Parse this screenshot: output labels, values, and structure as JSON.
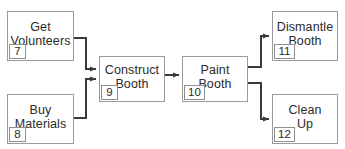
{
  "diagram": {
    "style": {
      "box_border_color": "#9a9a9a",
      "edge_color": "#3a3a3a",
      "text_color": "#2b2b2b",
      "background": "#ffffff"
    },
    "nodes": [
      {
        "id": "get-volunteers",
        "label": "Get\nVolunteers",
        "number": "7",
        "x": 7,
        "y": 11,
        "w": 67,
        "h": 50
      },
      {
        "id": "buy-materials",
        "label": "Buy\nMaterials",
        "number": "8",
        "x": 7,
        "y": 94,
        "w": 67,
        "h": 50
      },
      {
        "id": "construct-booth",
        "label": "Construct\nBooth",
        "number": "9",
        "x": 99,
        "y": 56,
        "w": 66,
        "h": 46
      },
      {
        "id": "paint-booth",
        "label": "Paint\nBooth",
        "number": "10",
        "x": 182,
        "y": 56,
        "w": 66,
        "h": 46
      },
      {
        "id": "dismantle-booth",
        "label": "Dismantle\nBooth",
        "number": "11",
        "x": 272,
        "y": 11,
        "w": 66,
        "h": 50
      },
      {
        "id": "clean-up",
        "label": "Clean\nUp",
        "number": "12",
        "x": 272,
        "y": 94,
        "w": 66,
        "h": 50
      }
    ],
    "edges": [
      {
        "id": "edge-volunteers-to-construct",
        "from": "get-volunteers",
        "to": "construct-booth"
      },
      {
        "id": "edge-materials-to-construct",
        "from": "buy-materials",
        "to": "construct-booth"
      },
      {
        "id": "edge-construct-to-paint",
        "from": "construct-booth",
        "to": "paint-booth"
      },
      {
        "id": "edge-paint-to-dismantle",
        "from": "paint-booth",
        "to": "dismantle-booth"
      },
      {
        "id": "edge-paint-to-cleanup",
        "from": "paint-booth",
        "to": "clean-up"
      }
    ]
  }
}
